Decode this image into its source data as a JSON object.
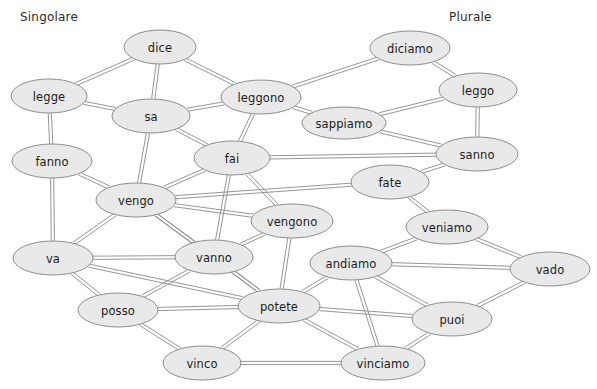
{
  "diagram": {
    "title_left": "Singolare",
    "title_right": "Plurale",
    "node_fill": "#e9e9e9",
    "node_stroke": "#8d8d8d",
    "edge_stroke": "#8a8a8a",
    "background": "#ffffff",
    "width": 597,
    "height": 389,
    "edge_style": "double-parallel-line",
    "edge_gap": 3.2
  },
  "nodes": [
    {
      "id": "dice",
      "label": "dice",
      "x": 160,
      "y": 47,
      "rx": 36,
      "ry": 17,
      "group": "singolare"
    },
    {
      "id": "legge",
      "label": "legge",
      "x": 49,
      "y": 96,
      "rx": 38,
      "ry": 17,
      "group": "singolare"
    },
    {
      "id": "sa",
      "label": "sa",
      "x": 151,
      "y": 116,
      "rx": 39,
      "ry": 17,
      "group": "singolare"
    },
    {
      "id": "fanno",
      "label": "fanno",
      "x": 52,
      "y": 161,
      "rx": 40,
      "ry": 17,
      "group": "plurale"
    },
    {
      "id": "fai",
      "label": "fai",
      "x": 232,
      "y": 158,
      "rx": 38,
      "ry": 17,
      "group": "singolare"
    },
    {
      "id": "vengo",
      "label": "vengo",
      "x": 136,
      "y": 200,
      "rx": 40,
      "ry": 17,
      "group": "singolare"
    },
    {
      "id": "va",
      "label": "va",
      "x": 53,
      "y": 258,
      "rx": 40,
      "ry": 17,
      "group": "singolare"
    },
    {
      "id": "vanno",
      "label": "vanno",
      "x": 214,
      "y": 257,
      "rx": 39,
      "ry": 17,
      "group": "plurale"
    },
    {
      "id": "posso",
      "label": "posso",
      "x": 118,
      "y": 310,
      "rx": 40,
      "ry": 17,
      "group": "singolare"
    },
    {
      "id": "vinco",
      "label": "vinco",
      "x": 202,
      "y": 363,
      "rx": 39,
      "ry": 17,
      "group": "singolare"
    },
    {
      "id": "vengono",
      "label": "vengono",
      "x": 292,
      "y": 221,
      "rx": 41,
      "ry": 17,
      "group": "plurale"
    },
    {
      "id": "potete",
      "label": "potete",
      "x": 279,
      "y": 306,
      "rx": 41,
      "ry": 17,
      "group": "plurale"
    },
    {
      "id": "andiamo",
      "label": "andiamo",
      "x": 351,
      "y": 263,
      "rx": 41,
      "ry": 17,
      "group": "plurale"
    },
    {
      "id": "vinciamo",
      "label": "vinciamo",
      "x": 383,
      "y": 363,
      "rx": 42,
      "ry": 17,
      "group": "plurale"
    },
    {
      "id": "leggono",
      "label": "leggono",
      "x": 261,
      "y": 97,
      "rx": 40,
      "ry": 17,
      "group": "plurale"
    },
    {
      "id": "sappiamo",
      "label": "sappiamo",
      "x": 344,
      "y": 123,
      "rx": 42,
      "ry": 16,
      "group": "plurale"
    },
    {
      "id": "diciamo",
      "label": "diciamo",
      "x": 410,
      "y": 48,
      "rx": 40,
      "ry": 17,
      "group": "plurale"
    },
    {
      "id": "leggo",
      "label": "leggo",
      "x": 478,
      "y": 90,
      "rx": 39,
      "ry": 17,
      "group": "singolare"
    },
    {
      "id": "sanno",
      "label": "sanno",
      "x": 477,
      "y": 154,
      "rx": 41,
      "ry": 17,
      "group": "plurale"
    },
    {
      "id": "fate",
      "label": "fate",
      "x": 390,
      "y": 182,
      "rx": 39,
      "ry": 17,
      "group": "plurale"
    },
    {
      "id": "veniamo",
      "label": "veniamo",
      "x": 447,
      "y": 227,
      "rx": 41,
      "ry": 17,
      "group": "plurale"
    },
    {
      "id": "vado",
      "label": "vado",
      "x": 550,
      "y": 269,
      "rx": 40,
      "ry": 17,
      "group": "singolare"
    },
    {
      "id": "puoi",
      "label": "puoi",
      "x": 452,
      "y": 319,
      "rx": 40,
      "ry": 17,
      "group": "singolare"
    }
  ],
  "edges": [
    {
      "source": "dice",
      "target": "legge"
    },
    {
      "source": "dice",
      "target": "sa"
    },
    {
      "source": "dice",
      "target": "leggono"
    },
    {
      "source": "legge",
      "target": "sa"
    },
    {
      "source": "legge",
      "target": "fanno"
    },
    {
      "source": "sa",
      "target": "leggono"
    },
    {
      "source": "sa",
      "target": "fai"
    },
    {
      "source": "sa",
      "target": "vengo"
    },
    {
      "source": "fanno",
      "target": "vengo"
    },
    {
      "source": "fanno",
      "target": "va"
    },
    {
      "source": "fai",
      "target": "leggono"
    },
    {
      "source": "fai",
      "target": "vengo"
    },
    {
      "source": "fai",
      "target": "sanno"
    },
    {
      "source": "fai",
      "target": "vanno"
    },
    {
      "source": "fai",
      "target": "vengono"
    },
    {
      "source": "vengo",
      "target": "va"
    },
    {
      "source": "vengo",
      "target": "vanno"
    },
    {
      "source": "vengo",
      "target": "vengono"
    },
    {
      "source": "vengo",
      "target": "potete"
    },
    {
      "source": "vengo",
      "target": "fate"
    },
    {
      "source": "va",
      "target": "vanno"
    },
    {
      "source": "va",
      "target": "posso"
    },
    {
      "source": "va",
      "target": "potete"
    },
    {
      "source": "vanno",
      "target": "vengono"
    },
    {
      "source": "vanno",
      "target": "potete"
    },
    {
      "source": "vanno",
      "target": "posso"
    },
    {
      "source": "posso",
      "target": "vinco"
    },
    {
      "source": "posso",
      "target": "potete"
    },
    {
      "source": "vinco",
      "target": "potete"
    },
    {
      "source": "vinco",
      "target": "vinciamo"
    },
    {
      "source": "vengono",
      "target": "potete"
    },
    {
      "source": "potete",
      "target": "andiamo"
    },
    {
      "source": "potete",
      "target": "vinciamo"
    },
    {
      "source": "potete",
      "target": "puoi"
    },
    {
      "source": "andiamo",
      "target": "veniamo"
    },
    {
      "source": "andiamo",
      "target": "puoi"
    },
    {
      "source": "andiamo",
      "target": "vinciamo"
    },
    {
      "source": "vinciamo",
      "target": "puoi"
    },
    {
      "source": "leggono",
      "target": "diciamo"
    },
    {
      "source": "leggono",
      "target": "sappiamo"
    },
    {
      "source": "sappiamo",
      "target": "leggo"
    },
    {
      "source": "sappiamo",
      "target": "sanno"
    },
    {
      "source": "diciamo",
      "target": "leggo"
    },
    {
      "source": "leggo",
      "target": "sanno"
    },
    {
      "source": "sanno",
      "target": "fate"
    },
    {
      "source": "fate",
      "target": "veniamo"
    },
    {
      "source": "veniamo",
      "target": "vado"
    },
    {
      "source": "vado",
      "target": "puoi"
    },
    {
      "source": "vado",
      "target": "andiamo"
    }
  ]
}
